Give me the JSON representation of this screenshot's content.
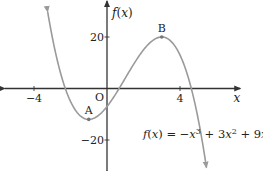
{
  "chart_data": {
    "type": "line",
    "title": "",
    "function": "f(x) = -x^3 + 3x^2 + 9x - 7",
    "function_label": "f(x) = −x³ + 3x² + 9x − 7",
    "xlabel": "x",
    "ylabel": "f(x)",
    "origin_label": "O",
    "xlim": [
      -5.6,
      7.3
    ],
    "ylim": [
      -32,
      34
    ],
    "x_ticks": [
      {
        "value": -4,
        "label": "−4"
      },
      {
        "value": 4,
        "label": "4"
      }
    ],
    "y_ticks": [
      {
        "value": 20,
        "label": "20"
      },
      {
        "value": -20,
        "label": "−20"
      }
    ],
    "domain_plotted": [
      -3.25,
      5.45
    ],
    "grid": false,
    "points": [
      {
        "name": "A",
        "x": -1,
        "y": -12,
        "role": "local minimum"
      },
      {
        "name": "B",
        "x": 3,
        "y": 20,
        "role": "local maximum"
      }
    ],
    "series": [
      {
        "name": "f(x)",
        "color": "#9a9a9a",
        "x": [
          -3.25,
          -3,
          -2,
          -1,
          0,
          1,
          2,
          3,
          4,
          5,
          5.45
        ],
        "values": [
          30.08,
          20,
          -5,
          -12,
          -7,
          4,
          15,
          20,
          13,
          -12,
          -30.7
        ]
      }
    ],
    "axis_color": "#333333",
    "curve_color": "#9a9a9a"
  }
}
